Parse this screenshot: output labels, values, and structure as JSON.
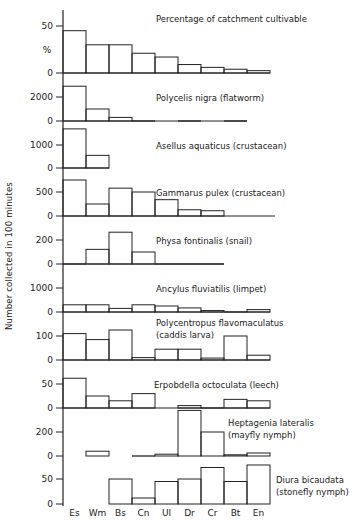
{
  "chart_data": {
    "type": "bar",
    "ylabel": "Number collected in 100 minutes",
    "categories": [
      "Es",
      "Wm",
      "Bs",
      "Cn",
      "Ul",
      "Dr",
      "Cr",
      "Bt",
      "En"
    ],
    "panels": [
      {
        "title": "Percentage of catchment cultivable",
        "unit_label": "%",
        "ticks": [
          0,
          50
        ],
        "values": [
          45,
          30,
          30,
          21,
          17,
          9,
          6,
          4,
          2.5
        ]
      },
      {
        "title": "Polycelis nigra (flatworm)",
        "ticks": [
          0,
          2000
        ],
        "values": [
          2900,
          1000,
          300,
          40,
          null,
          0,
          null,
          0,
          null
        ]
      },
      {
        "title": "Asellus aquaticus (crustacean)",
        "ticks": [
          0,
          1000
        ],
        "values": [
          1700,
          550,
          null,
          null,
          null,
          null,
          null,
          null,
          null
        ]
      },
      {
        "title": "Gammarus pulex (crustacean)",
        "ticks": [
          0,
          500
        ],
        "values": [
          750,
          250,
          580,
          500,
          340,
          130,
          110,
          null,
          null
        ]
      },
      {
        "title": "Physa fontinalis (snail)",
        "ticks": [
          0,
          200
        ],
        "values": [
          5,
          122,
          265,
          100,
          0,
          5,
          5,
          null,
          null
        ]
      },
      {
        "title": "Ancylus fluviatilis (limpet)",
        "ticks": [
          0,
          1000
        ],
        "values": [
          300,
          300,
          150,
          300,
          250,
          170,
          60,
          40,
          100
        ]
      },
      {
        "title": "Polycentropus flavomaculatus",
        "title2": "(caddis larva)",
        "ticks": [
          0,
          100
        ],
        "values": [
          110,
          85,
          125,
          10,
          45,
          45,
          8,
          100,
          20
        ]
      },
      {
        "title": "Erpobdella octoculata (leech)",
        "ticks": [
          0,
          50
        ],
        "values": [
          62,
          25,
          15,
          30,
          null,
          5,
          2,
          18,
          15
        ]
      },
      {
        "title": "Heptagenia lateralis",
        "title2": "(mayfly nymph)",
        "ticks": [
          0,
          200
        ],
        "values": [
          null,
          40,
          null,
          0,
          15,
          380,
          200,
          10,
          25
        ]
      },
      {
        "title": "Diura bicaudata",
        "title2": "(stonefly nymph)",
        "ticks": [
          0,
          50
        ],
        "values": [
          null,
          null,
          50,
          12,
          45,
          50,
          73,
          45,
          78
        ]
      }
    ]
  }
}
